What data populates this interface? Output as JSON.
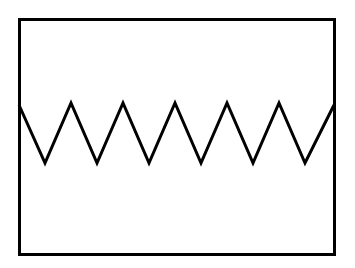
{
  "figure": {
    "background_color": "#ffffff",
    "canvas": {
      "width": 355,
      "height": 268
    },
    "frame": {
      "name": "rectangular-border",
      "x": 19.5,
      "y": 19.5,
      "width": 315,
      "height": 235,
      "stroke_color": "#000000",
      "stroke_width": 3,
      "fill": "none"
    },
    "wave": {
      "name": "triangle-wave",
      "shape": "zigzag",
      "stroke_color": "#000000",
      "stroke_width": 3,
      "peak_y": 103,
      "trough_y": 163,
      "amplitude": 60,
      "period": 52,
      "peak_count": 6,
      "trough_count": 6,
      "start_point": {
        "x": 19,
        "y": 105
      },
      "end_point": {
        "x": 334,
        "y": 105
      },
      "vertices": [
        {
          "x": 19,
          "y": 105
        },
        {
          "x": 45,
          "y": 163
        },
        {
          "x": 71,
          "y": 103
        },
        {
          "x": 97,
          "y": 163
        },
        {
          "x": 123,
          "y": 103
        },
        {
          "x": 149,
          "y": 163
        },
        {
          "x": 175,
          "y": 103
        },
        {
          "x": 201,
          "y": 163
        },
        {
          "x": 227,
          "y": 103
        },
        {
          "x": 253,
          "y": 163
        },
        {
          "x": 279,
          "y": 103
        },
        {
          "x": 305,
          "y": 163
        },
        {
          "x": 334,
          "y": 105
        }
      ],
      "path_d": "M 19,105 L 45,163 L 71,103 L 97,163 L 123,103 L 149,163 L 175,103 L 201,163 L 227,103 L 253,163 L 279,103 L 305,163 L 334,105"
    }
  },
  "chart_data": {
    "type": "line",
    "xlabel": "",
    "ylabel": "",
    "grid": false,
    "legend": null,
    "xlim": [
      19,
      334
    ],
    "ylim": [
      163,
      103
    ],
    "series": [
      {
        "name": "triangle-wave",
        "x": [
          19,
          45,
          71,
          97,
          123,
          149,
          175,
          201,
          227,
          253,
          279,
          305,
          334
        ],
        "values": [
          105,
          163,
          103,
          163,
          103,
          163,
          103,
          163,
          103,
          163,
          103,
          163,
          105
        ]
      }
    ]
  }
}
